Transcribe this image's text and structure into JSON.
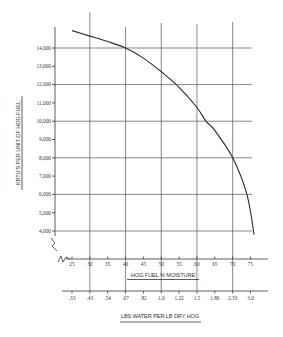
{
  "chart_data": {
    "type": "line",
    "title": "",
    "xlabel": "HOG FUEL % MOISTURE",
    "xlabel_secondary": "LBS WATER PER LB DRY HOG",
    "ylabel": "KBTU'S PER UNIT OF HOG FUEL",
    "xlim": [
      25,
      75
    ],
    "ylim": [
      4000,
      14000
    ],
    "x_ticks": [
      25,
      30,
      35,
      40,
      45,
      50,
      55,
      60,
      65,
      70,
      75
    ],
    "x_tick_labels": [
      "25",
      "30",
      "35",
      "40",
      "45",
      "50",
      "55",
      "60",
      "65",
      "70",
      "75"
    ],
    "x_secondary_tick_labels": [
      ".33",
      ".43",
      ".54",
      ".67",
      ".82",
      "1.0",
      "1.22",
      "1.5",
      "1.86",
      "2.33",
      "3.0"
    ],
    "y_ticks": [
      14000,
      13000,
      12000,
      11000,
      10000,
      9000,
      8000,
      7000,
      6000,
      5000,
      4000
    ],
    "y_tick_labels": [
      "14,000",
      "13,000",
      "12,000",
      "11,000",
      "10,000",
      "9,000",
      "8,000",
      "7,000",
      "6,000",
      "5,000",
      "4,000"
    ],
    "grid": true,
    "major_x_grid": [
      30,
      40,
      50,
      60,
      70
    ],
    "major_y_grid": [
      14000,
      12000,
      10000,
      8000,
      6000,
      4000
    ],
    "axis_breaks": true,
    "series": [
      {
        "name": "KBTU per unit of hog fuel",
        "x": [
          25,
          30,
          35,
          40,
          45,
          50,
          55,
          60,
          62.5,
          65,
          70,
          74,
          76
        ],
        "y": [
          14950,
          14650,
          14350,
          14000,
          13450,
          12700,
          11850,
          10750,
          10000,
          9500,
          8000,
          6000,
          3800
        ]
      }
    ]
  }
}
